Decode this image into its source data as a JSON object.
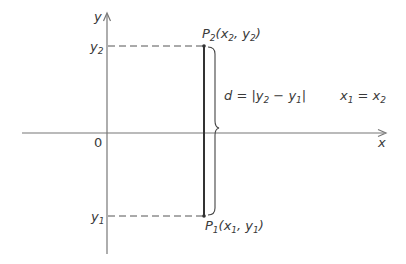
{
  "diagram": {
    "axes": {
      "x_label": "x",
      "y_label": "y",
      "origin_label": "0"
    },
    "y_ticks": {
      "y2": {
        "base": "y",
        "sub": "2"
      },
      "y1": {
        "base": "y",
        "sub": "1"
      }
    },
    "points": {
      "p2": {
        "name": "P",
        "sub": "2",
        "open": "(x",
        "xsub": "2",
        "mid": ", y",
        "ysub": "2",
        "close": ")"
      },
      "p1": {
        "name": "P",
        "sub": "1",
        "open": "(x",
        "xsub": "1",
        "mid": ", y",
        "ysub": "1",
        "close": ")"
      }
    },
    "distance_formula": {
      "lhs": "d = |y",
      "sub_a": "2",
      "mid": " − y",
      "sub_b": "1",
      "rhs": "|"
    },
    "condition": {
      "a": "x",
      "a_sub": "1",
      "eq": " = x",
      "b_sub": "2"
    },
    "colors": {
      "axis": "#777777",
      "segment": "#333333",
      "dash": "#555555",
      "text": "#3a3a3a"
    }
  }
}
